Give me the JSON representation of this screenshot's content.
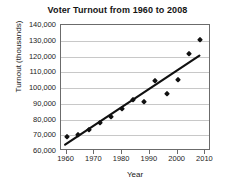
{
  "chart_data": {
    "type": "scatter",
    "title": "Voter Turnout from 1960 to 2008",
    "xlabel": "Year",
    "ylabel": "Turnout (thousands)",
    "xlim": [
      1958,
      2012
    ],
    "ylim": [
      60000,
      140000
    ],
    "grid": true,
    "legend": null,
    "x_ticks": [
      1960,
      1970,
      1980,
      1990,
      2000,
      2010
    ],
    "x_tick_labels": [
      "1960",
      "1970",
      "1980",
      "1990",
      "2000",
      "2010"
    ],
    "y_ticks": [
      60000,
      70000,
      80000,
      90000,
      100000,
      110000,
      120000,
      130000,
      140000
    ],
    "y_tick_labels": [
      "60,000",
      "70,000",
      "80,000",
      "90,000",
      "100,000",
      "110,000",
      "120,000",
      "130,000",
      "140,000"
    ],
    "series": [
      {
        "name": "Voter turnout",
        "marker": "diamond",
        "color": "#111111",
        "points": [
          {
            "x": 1960,
            "y": 68800
          },
          {
            "x": 1964,
            "y": 70100
          },
          {
            "x": 1968,
            "y": 73200
          },
          {
            "x": 1972,
            "y": 77600
          },
          {
            "x": 1976,
            "y": 81600
          },
          {
            "x": 1980,
            "y": 86500
          },
          {
            "x": 1984,
            "y": 92700
          },
          {
            "x": 1988,
            "y": 91000
          },
          {
            "x": 1992,
            "y": 104400
          },
          {
            "x": 1996,
            "y": 96300
          },
          {
            "x": 2000,
            "y": 105400
          },
          {
            "x": 2004,
            "y": 121500
          },
          {
            "x": 2008,
            "y": 130500
          }
        ]
      }
    ],
    "trendline": {
      "name": "Line of best fit",
      "color": "#111111",
      "start": {
        "x": 1959.5,
        "y": 62800
      },
      "end": {
        "x": 2008.5,
        "y": 120300
      }
    }
  }
}
